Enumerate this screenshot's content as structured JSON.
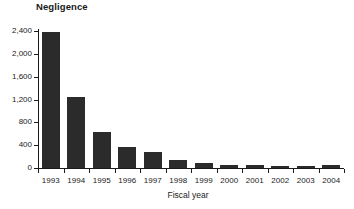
{
  "chart_data": {
    "type": "bar",
    "title": "Negligence",
    "xlabel": "Fiscal year",
    "ylabel": "",
    "categories": [
      "1993",
      "1994",
      "1995",
      "1996",
      "1997",
      "1998",
      "1999",
      "2000",
      "2001",
      "2002",
      "2003",
      "2004"
    ],
    "values": [
      2390,
      1240,
      630,
      370,
      280,
      140,
      80,
      50,
      50,
      40,
      30,
      45
    ],
    "ylim": [
      0,
      2400
    ],
    "yticks": [
      0,
      400,
      800,
      1200,
      1600,
      2000,
      2400
    ],
    "ytick_labels": [
      "0",
      "400",
      "800",
      "1,200",
      "1,600",
      "2,000",
      "2,400"
    ],
    "grid": false,
    "legend": null,
    "bar_color": "#2b2b2b",
    "axis_color": "#1a1a1a"
  }
}
